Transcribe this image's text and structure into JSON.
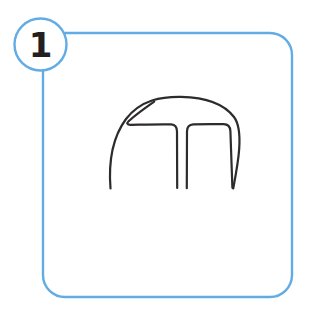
{
  "card": {
    "step_number": "1",
    "badge_icon_name": "step-number-badge-icon",
    "frame_icon_name": "rounded-rectangle-frame-icon",
    "frame": {
      "x": 43,
      "y": 33,
      "width": 249,
      "height": 264,
      "corner_radius": 22,
      "stroke_color": "#62ACE5",
      "stroke_width": 2.4,
      "fill_color": "#FFFFFF"
    },
    "badge": {
      "center_x": 40.5,
      "center_y": 44.5,
      "radius": 26,
      "stroke_color": "#62ACE5",
      "stroke_width": 2.4,
      "fill_color": "#FFFFFF",
      "label_color": "#231F20"
    }
  },
  "sketch": {
    "icon_name": "dome-arch-sketch-icon",
    "description": "Hand-drawn dome arch with inner arches and four legs",
    "stroke_color": "#2E2B2C",
    "stroke_width": 2.2,
    "fill": "none",
    "bounds": {
      "x": 105,
      "y": 95,
      "width": 133,
      "height": 94
    },
    "apex": {
      "x": 180,
      "y": 97
    },
    "leg_base_y": 189,
    "legs_x": [
      110,
      177,
      187,
      232
    ],
    "paths": {
      "outer_dome": "M 110.5 188.5 C 108.5 163 112 138 126 119 C 141 99.5 162 96.5 181 96.8 C 201 97.2 222 101 234 117 C 244.5 131 237.5 166 233.2 188.5",
      "left_inner_arch": "M 177.2 188.0 C 177.0 166 177.1 144 177.0 131.5 C 176.9 126.8 175.4 124.6 171.2 124.4 C 162 124.0 142 124.6 130.6 124.8 C 127.2 124.9 126.4 123.2 128.6 121.2 C 136 114.4 147 106.6 154.2 101.6",
      "right_inner_arch": "M 186.8 188.2 C 186.9 166 186.8 143 187.0 131.4 C 187.1 126.6 188.8 124.6 193.2 124.4 C 203 124.0 215 124.0 223.6 124.2 C 228.4 124.3 230.2 126.4 230.4 131.2 C 230.9 144 231.6 166 232.4 187.8"
    }
  }
}
